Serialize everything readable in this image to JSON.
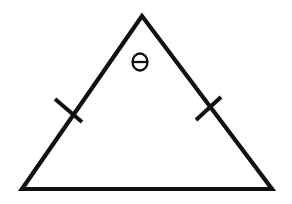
{
  "figure": {
    "title": "Isosceles triangle with apex angle theta and congruent leg marks",
    "background_color": "#ffffff",
    "stroke_color": "#111111",
    "canvas": {
      "width": 292,
      "height": 204
    },
    "angle_label": {
      "symbol": "θ",
      "name": "theta",
      "position": {
        "x": 140,
        "y": 62
      },
      "width": 15,
      "height": 17
    },
    "triangle": {
      "type": "isosceles",
      "stroke_width": 4.2,
      "vertices": [
        {
          "name": "apex",
          "x": 142,
          "y": 16
        },
        {
          "name": "bottom-left",
          "x": 22,
          "y": 189
        },
        {
          "name": "bottom-right",
          "x": 272,
          "y": 189
        }
      ],
      "path": "M 142 16 L 22 189 L 272 189 Z"
    },
    "tick_marks": [
      {
        "name": "left-leg-tick",
        "side": "left",
        "center": {
          "x": 68,
          "y": 110
        },
        "path": "M 55 99 L 82 122"
      },
      {
        "name": "right-leg-tick",
        "side": "right",
        "center": {
          "x": 208,
          "y": 108
        },
        "path": "M 196 120 L 221 97"
      }
    ]
  }
}
